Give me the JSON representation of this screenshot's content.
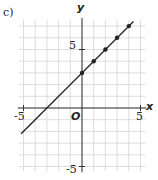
{
  "panel_label": "c)",
  "chart_data": {
    "type": "line",
    "title": "",
    "xlabel": "x",
    "ylabel": "y",
    "origin_label": "O",
    "xlim": [
      -5,
      5
    ],
    "ylim": [
      -5,
      7
    ],
    "xticks": [
      -5,
      5
    ],
    "yticks": [
      5,
      -5
    ],
    "grid": true,
    "series": [
      {
        "name": "y = x + 3",
        "line": {
          "x": [
            -5.2,
            4.4
          ],
          "y": [
            -2.2,
            7.4
          ]
        },
        "points": {
          "x": [
            0,
            1,
            2,
            3,
            4
          ],
          "y": [
            3,
            4,
            5,
            6,
            7
          ]
        }
      }
    ]
  },
  "tick_labels": {
    "x_neg": "-5",
    "x_pos": "5",
    "y_pos": "5",
    "y_neg": "-5"
  },
  "colors": {
    "grid": "#d4d4d4",
    "axis": "#333333",
    "line": "#222222"
  }
}
